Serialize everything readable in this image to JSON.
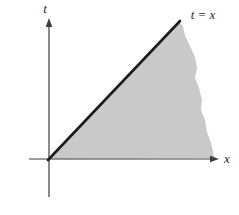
{
  "figure": {
    "labels": {
      "t_axis": "t",
      "x_axis": "x",
      "line": "t = x"
    },
    "colors": {
      "background": "#ffffff",
      "region_fill": "#c9c9c9",
      "line": "#1c1c1c",
      "axis": "#3d3d3d"
    }
  }
}
